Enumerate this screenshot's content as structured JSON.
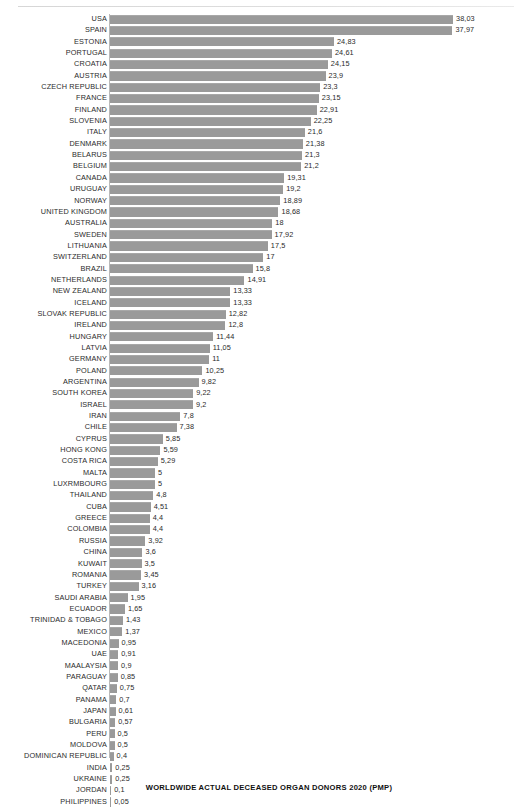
{
  "chart_data": {
    "type": "bar",
    "orientation": "horizontal",
    "title": "WORLDWIDE ACTUAL DECEASED ORGAN DONORS 2020 (PMP)",
    "xlabel": "",
    "ylabel": "",
    "xlim": [
      0,
      38.03
    ],
    "grid": false,
    "legend": null,
    "bar_color": "#9a9a9a",
    "decimal_separator": ",",
    "value_label_position": "outside-end",
    "categories": [
      "USA",
      "SPAIN",
      "ESTONIA",
      "PORTUGAL",
      "CROATIA",
      "AUSTRIA",
      "CZECH REPUBLIC",
      "FRANCE",
      "FINLAND",
      "SLOVENIA",
      "ITALY",
      "DENMARK",
      "BELARUS",
      "BELGIUM",
      "CANADA",
      "URUGUAY",
      "NORWAY",
      "UNITED KINGDOM",
      "AUSTRALIA",
      "SWEDEN",
      "LITHUANIA",
      "SWITZERLAND",
      "BRAZIL",
      "NETHERLANDS",
      "NEW ZEALAND",
      "ICELAND",
      "SLOVAK REPUBLIC",
      "IRELAND",
      "HUNGARY",
      "LATVIA",
      "GERMANY",
      "POLAND",
      "ARGENTINA",
      "SOUTH KOREA",
      "ISRAEL",
      "IRAN",
      "CHILE",
      "CYPRUS",
      "HONG KONG",
      "COSTA RICA",
      "MALTA",
      "LUXRMBOURG",
      "THAILAND",
      "CUBA",
      "GREECE",
      "COLOMBIA",
      "RUSSIA",
      "CHINA",
      "KUWAIT",
      "ROMANIA",
      "TURKEY",
      "SAUDI ARABIA",
      "ECUADOR",
      "TRINIDAD & TOBAGO",
      "MEXICO",
      "MACEDONIA",
      "UAE",
      "MAALAYSIA",
      "PARAGUAY",
      "QATAR",
      "PANAMA",
      "JAPAN",
      "BULGARIA",
      "PERU",
      "MOLDOVA",
      "DOMINICAN REPUBLIC",
      "INDIA",
      "UKRAINE",
      "JORDAN",
      "PHILIPPINES"
    ],
    "values": [
      38.03,
      37.97,
      24.83,
      24.61,
      24.15,
      23.9,
      23.3,
      23.15,
      22.91,
      22.25,
      21.6,
      21.38,
      21.3,
      21.2,
      19.31,
      19.2,
      18.89,
      18.68,
      18,
      17.92,
      17.5,
      17,
      15.8,
      14.91,
      13.33,
      13.33,
      12.82,
      12.8,
      11.44,
      11.05,
      11,
      10.25,
      9.82,
      9.22,
      9.2,
      7.8,
      7.38,
      5.85,
      5.59,
      5.29,
      5,
      5,
      4.8,
      4.51,
      4.4,
      4.4,
      3.92,
      3.6,
      3.5,
      3.45,
      3.16,
      1.95,
      1.65,
      1.43,
      1.37,
      0.95,
      0.91,
      0.9,
      0.85,
      0.75,
      0.7,
      0.61,
      0.57,
      0.5,
      0.5,
      0.4,
      0.25,
      0.25,
      0.1,
      0.05
    ],
    "value_labels": [
      "38,03",
      "37,97",
      "24,83",
      "24,61",
      "24,15",
      "23,9",
      "23,3",
      "23,15",
      "22,91",
      "22,25",
      "21,6",
      "21,38",
      "21,3",
      "21,2",
      "19,31",
      "19,2",
      "18,89",
      "18,68",
      "18",
      "17,92",
      "17,5",
      "17",
      "15,8",
      "14,91",
      "13,33",
      "13,33",
      "12,82",
      "12,8",
      "11,44",
      "11,05",
      "11",
      "10,25",
      "9,82",
      "9,22",
      "9,2",
      "7,8",
      "7,38",
      "5,85",
      "5,59",
      "5,29",
      "5",
      "5",
      "4,8",
      "4,51",
      "4,4",
      "4,4",
      "3,92",
      "3,6",
      "3,5",
      "3,45",
      "3,16",
      "1,95",
      "1,65",
      "1,43",
      "1,37",
      "0,95",
      "0,91",
      "0,9",
      "0,85",
      "0,75",
      "0,7",
      "0,61",
      "0,57",
      "0,5",
      "0,5",
      "0,4",
      "0,25",
      "0,25",
      "0,1",
      "0,05"
    ]
  }
}
